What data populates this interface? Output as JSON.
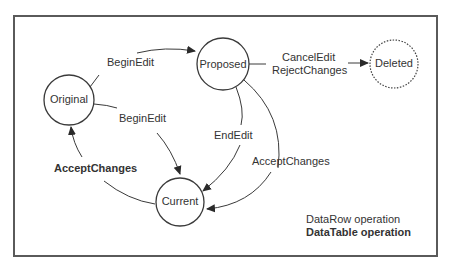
{
  "diagram": {
    "colors": {
      "line": "#3a3a3a",
      "text": "#333333",
      "border": "#555555",
      "background": "#ffffff"
    },
    "nodes": [
      {
        "id": "original",
        "label": "Original",
        "style": "solid"
      },
      {
        "id": "proposed",
        "label": "Proposed",
        "style": "solid"
      },
      {
        "id": "deleted",
        "label": "Deleted",
        "style": "dotted"
      },
      {
        "id": "current",
        "label": "Current",
        "style": "solid"
      }
    ],
    "edges": [
      {
        "from": "original",
        "to": "proposed",
        "label": "BeginEdit",
        "type": "DataRow operation"
      },
      {
        "from": "original",
        "to": "current",
        "label": "BeginEdit",
        "type": "DataRow operation"
      },
      {
        "from": "proposed",
        "to": "deleted",
        "label": "CancelEdit\nRejectChanges",
        "label_lines": [
          "CancelEdit",
          "RejectChanges"
        ],
        "type": "DataRow operation"
      },
      {
        "from": "proposed",
        "to": "current",
        "label": "EndEdit",
        "type": "DataRow operation"
      },
      {
        "from": "proposed",
        "to": "current",
        "label": "AcceptChanges",
        "type": "DataRow operation"
      },
      {
        "from": "current",
        "to": "original",
        "label": "AcceptChanges",
        "type": "DataTable operation"
      }
    ],
    "legend": {
      "datarow": "DataRow operation",
      "datatable": "DataTable operation"
    }
  }
}
